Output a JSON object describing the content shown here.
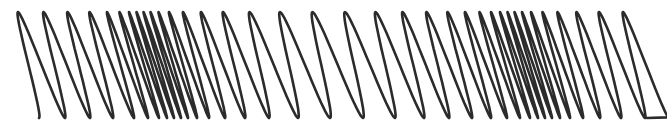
{
  "image": {
    "description": "Helical spring (slinky) illustrating a longitudinal wave with compressions and rarefactions",
    "width": 667,
    "height": 131,
    "background": "#ffffff"
  },
  "spring": {
    "stroke_color": "#2b2b2b",
    "stroke_width": 2.6,
    "top_y": 12,
    "bottom_y": 118,
    "loop_half_width": 17,
    "start": {
      "x": 24,
      "y": 108
    },
    "end": {
      "x": 647,
      "y": 118
    },
    "loop_centers_x": [
      22,
      48,
      73,
      96,
      117,
      131,
      142,
      150,
      157,
      164,
      171,
      180,
      192,
      208,
      228,
      252,
      281,
      313,
      346,
      378,
      407,
      432,
      455,
      474,
      490,
      503,
      513,
      521,
      528,
      535,
      543,
      553,
      566,
      583,
      604,
      628
    ],
    "compressions_x": [
      155,
      525
    ],
    "rarefactions_x": [
      330
    ]
  }
}
